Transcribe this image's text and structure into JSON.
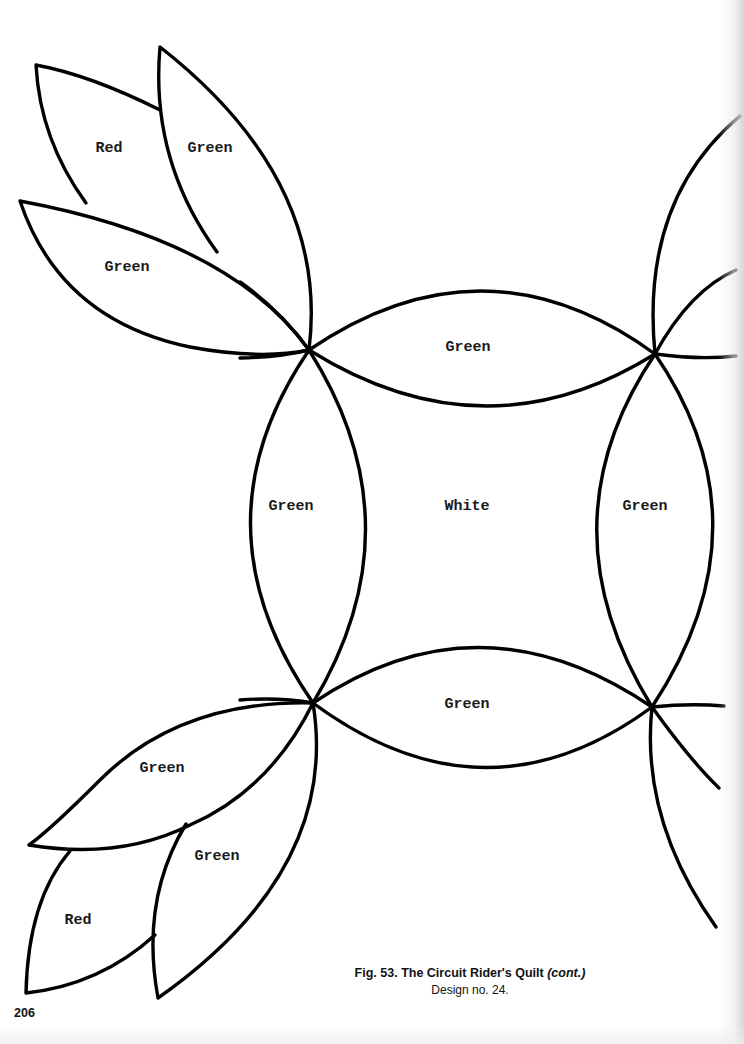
{
  "pattern": {
    "name": "The Circuit Rider's Quilt",
    "labels": {
      "top_left_red": "Red",
      "top_left_green_upper": "Green",
      "top_left_green_lower": "Green",
      "arc_top": "Green",
      "arc_left": "Green",
      "center": "White",
      "arc_right": "Green",
      "arc_bottom": "Green",
      "bottom_left_green_upper": "Green",
      "bottom_left_green_lower": "Green",
      "bottom_left_red": "Red"
    },
    "stroke_color": "#000000"
  },
  "caption": {
    "title_main": "Fig. 53. The Circuit Rider's Quilt ",
    "title_suffix": "(cont.)",
    "subtitle": "Design no. 24."
  },
  "page_number": "206"
}
